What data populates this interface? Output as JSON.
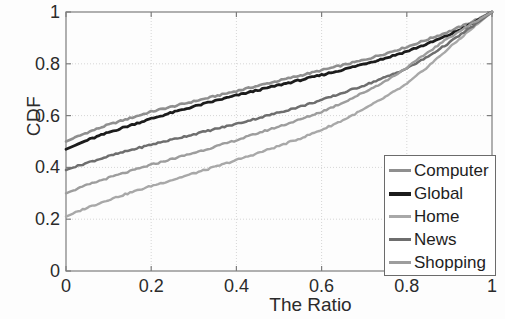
{
  "chart_data": {
    "type": "line",
    "title": "",
    "subtitle": "",
    "xlabel": "The Ratio",
    "ylabel": "CDF",
    "xlim": [
      0,
      1
    ],
    "ylim": [
      0,
      1
    ],
    "xticks": [
      "0",
      "0.2",
      "0.4",
      "0.6",
      "0.8",
      "1"
    ],
    "xtick_values": [
      0,
      0.2,
      0.4,
      0.6,
      0.8,
      1
    ],
    "yticks": [
      "0",
      "0.2",
      "0.4",
      "0.6",
      "0.8",
      "1"
    ],
    "ytick_values": [
      0,
      0.2,
      0.4,
      0.6,
      0.8,
      1
    ],
    "grid": true,
    "legend_position": "lower right",
    "x": [
      0,
      0.05,
      0.1,
      0.15,
      0.2,
      0.25,
      0.3,
      0.35,
      0.4,
      0.45,
      0.5,
      0.55,
      0.6,
      0.65,
      0.7,
      0.75,
      0.8,
      0.85,
      0.9,
      0.95,
      1
    ],
    "series": [
      {
        "name": "Computer",
        "color": "#8f8f8f",
        "width": 2.6,
        "values": [
          0.5,
          0.535,
          0.565,
          0.59,
          0.615,
          0.635,
          0.655,
          0.675,
          0.695,
          0.715,
          0.735,
          0.755,
          0.775,
          0.795,
          0.815,
          0.84,
          0.865,
          0.895,
          0.925,
          0.96,
          1.0
        ]
      },
      {
        "name": "Global",
        "color": "#1c1c1c",
        "width": 2.8,
        "values": [
          0.47,
          0.505,
          0.535,
          0.562,
          0.588,
          0.612,
          0.635,
          0.657,
          0.678,
          0.698,
          0.718,
          0.737,
          0.757,
          0.777,
          0.8,
          0.822,
          0.848,
          0.878,
          0.912,
          0.952,
          1.0
        ]
      },
      {
        "name": "Home",
        "color": "#a8a8a8",
        "width": 2.4,
        "values": [
          0.21,
          0.245,
          0.275,
          0.302,
          0.328,
          0.352,
          0.377,
          0.402,
          0.428,
          0.455,
          0.483,
          0.512,
          0.545,
          0.582,
          0.625,
          0.672,
          0.722,
          0.79,
          0.862,
          0.932,
          1.0
        ]
      },
      {
        "name": "News",
        "color": "#6e6e6e",
        "width": 2.5,
        "values": [
          0.39,
          0.418,
          0.443,
          0.466,
          0.488,
          0.508,
          0.528,
          0.548,
          0.568,
          0.59,
          0.612,
          0.635,
          0.66,
          0.688,
          0.717,
          0.748,
          0.782,
          0.828,
          0.882,
          0.94,
          1.0
        ]
      },
      {
        "name": "Shopping",
        "color": "#9d9d9d",
        "width": 2.4,
        "values": [
          0.3,
          0.332,
          0.36,
          0.385,
          0.41,
          0.433,
          0.456,
          0.48,
          0.505,
          0.532,
          0.558,
          0.585,
          0.615,
          0.65,
          0.69,
          0.733,
          0.785,
          0.845,
          0.902,
          0.952,
          1.0
        ]
      }
    ]
  },
  "axes": {
    "x_tick_labels": [
      "0",
      "0.2",
      "0.4",
      "0.6",
      "0.8",
      "1"
    ],
    "y_tick_labels": [
      "0",
      "0.2",
      "0.4",
      "0.6",
      "0.8",
      "1"
    ],
    "x_axis_title": "The Ratio",
    "y_axis_title": "CDF"
  },
  "legend": {
    "items": [
      {
        "label": "Computer",
        "color": "#8f8f8f",
        "width": 3
      },
      {
        "label": "Global",
        "color": "#1c1c1c",
        "width": 4
      },
      {
        "label": "Home",
        "color": "#a8a8a8",
        "width": 3
      },
      {
        "label": "News",
        "color": "#6e6e6e",
        "width": 3
      },
      {
        "label": "Shopping",
        "color": "#9d9d9d",
        "width": 3
      }
    ]
  },
  "style": {
    "axis_color": "#7d7d7d",
    "grid_color": "#d6d6d6",
    "text_color": "#2b2b2b",
    "background": "#fdfdfd"
  }
}
